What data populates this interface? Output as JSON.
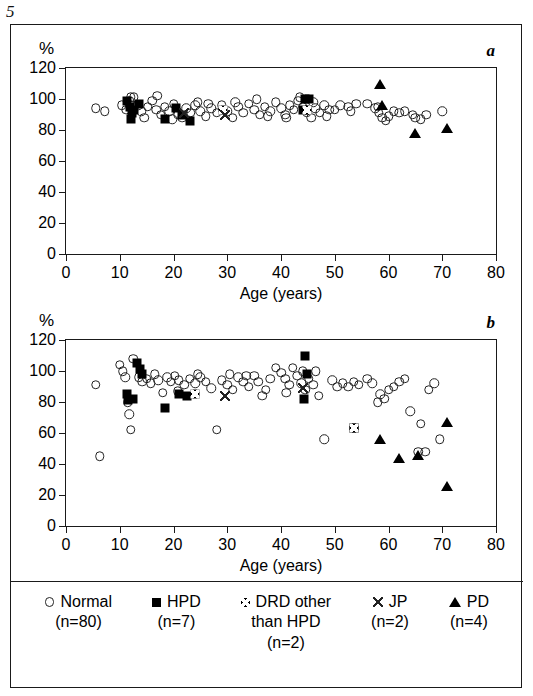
{
  "figure": {
    "number": "5",
    "x_title": "Age (years)",
    "y_unit": "%",
    "panel_a_letter": "a",
    "panel_b_letter": "b"
  },
  "axes": {
    "y_ticks": [
      0,
      20,
      40,
      60,
      80,
      100,
      120
    ],
    "x_ticks": [
      0,
      10,
      20,
      30,
      40,
      50,
      60,
      70,
      80
    ],
    "ylim": [
      0,
      120
    ],
    "xlim": [
      0,
      80
    ]
  },
  "legend": {
    "items": [
      {
        "symbol": "open-circle",
        "label": "Normal",
        "n": "(n=80)",
        "label2": ""
      },
      {
        "symbol": "filled-square",
        "label": "HPD",
        "n": "(n=7)",
        "label2": ""
      },
      {
        "symbol": "crossed-square",
        "label": "DRD other",
        "n": "(n=2)",
        "label2": "than HPD"
      },
      {
        "symbol": "cross",
        "label": "JP",
        "n": "(n=2)",
        "label2": ""
      },
      {
        "symbol": "filled-triangle",
        "label": "PD",
        "n": "(n=4)",
        "label2": ""
      }
    ]
  },
  "chart_data": [
    {
      "type": "scatter",
      "panel": "a",
      "title": "",
      "xlabel": "Age (years)",
      "ylabel": "%",
      "xlim": [
        0,
        80
      ],
      "ylim": [
        0,
        120
      ],
      "grid": false,
      "series": [
        {
          "name": "Normal",
          "marker": "open-circle",
          "points": [
            [
              5.5,
              94
            ],
            [
              7.2,
              92
            ],
            [
              10.4,
              96
            ],
            [
              11.2,
              93
            ],
            [
              11.8,
              99
            ],
            [
              12.6,
              101
            ],
            [
              13.4,
              96
            ],
            [
              14.0,
              92
            ],
            [
              14.6,
              88
            ],
            [
              15.2,
              95
            ],
            [
              16.0,
              99
            ],
            [
              16.8,
              93
            ],
            [
              17.6,
              90
            ],
            [
              18.4,
              95
            ],
            [
              19.2,
              92
            ],
            [
              20.0,
              97
            ],
            [
              20.8,
              90
            ],
            [
              21.6,
              88
            ],
            [
              22.4,
              94
            ],
            [
              23.2,
              91
            ],
            [
              24.0,
              96
            ],
            [
              25.0,
              92
            ],
            [
              26.0,
              89
            ],
            [
              27.0,
              94
            ],
            [
              28.0,
              91
            ],
            [
              29.0,
              96
            ],
            [
              30.0,
              92
            ],
            [
              31.0,
              88
            ],
            [
              32.0,
              95
            ],
            [
              33.0,
              91
            ],
            [
              34.0,
              97
            ],
            [
              35.0,
              93
            ],
            [
              36.0,
              90
            ],
            [
              37.0,
              95
            ],
            [
              38.0,
              92
            ],
            [
              39.0,
              98
            ],
            [
              40.0,
              94
            ],
            [
              40.8,
              90
            ],
            [
              41.6,
              96
            ],
            [
              42.4,
              93
            ],
            [
              43.2,
              99
            ],
            [
              44.0,
              95
            ],
            [
              44.8,
              91
            ],
            [
              45.6,
              88
            ],
            [
              46.4,
              94
            ],
            [
              47.2,
              91
            ],
            [
              48.0,
              96
            ],
            [
              49.0,
              93
            ],
            [
              51.0,
              96
            ],
            [
              52.5,
              95
            ],
            [
              54.0,
              97
            ],
            [
              57.5,
              94
            ],
            [
              58.2,
              91
            ],
            [
              58.8,
              88
            ],
            [
              59.5,
              86
            ],
            [
              61.0,
              92
            ],
            [
              62.0,
              91
            ],
            [
              63.0,
              92
            ],
            [
              64.5,
              90
            ],
            [
              66.0,
              87
            ],
            [
              70.0,
              92
            ],
            [
              12.0,
              101
            ],
            [
              17.0,
              102
            ],
            [
              24.5,
              98
            ],
            [
              35.5,
              100
            ],
            [
              43.5,
              101
            ],
            [
              46.0,
              98
            ],
            [
              50.0,
              93
            ],
            [
              53.0,
              92
            ],
            [
              56.0,
              97
            ],
            [
              58.0,
              95
            ],
            [
              60.0,
              89
            ],
            [
              65.0,
              88
            ],
            [
              67.0,
              90
            ],
            [
              19.8,
              87
            ],
            [
              26.5,
              97
            ],
            [
              31.5,
              98
            ],
            [
              37.5,
              89
            ],
            [
              41.0,
              88
            ],
            [
              48.5,
              89
            ]
          ]
        },
        {
          "name": "HPD",
          "marker": "filled-square",
          "points": [
            [
              11.3,
              99
            ],
            [
              11.9,
              95
            ],
            [
              12.2,
              91
            ],
            [
              12.0,
              87
            ],
            [
              12.7,
              93
            ],
            [
              13.5,
              97
            ],
            [
              18.5,
              87
            ],
            [
              20.5,
              94
            ],
            [
              21.5,
              90
            ],
            [
              23.0,
              86
            ],
            [
              44.5,
              100
            ],
            [
              45.3,
              100
            ],
            [
              44.0,
              93
            ]
          ]
        },
        {
          "name": "DRD other than HPD",
          "marker": "crossed-square",
          "points": [
            [
              29.2,
              93
            ],
            [
              44.8,
              93
            ]
          ]
        },
        {
          "name": "JP",
          "marker": "cross",
          "points": [
            [
              22.0,
              91
            ],
            [
              29.5,
              90
            ]
          ]
        },
        {
          "name": "PD",
          "marker": "filled-triangle",
          "points": [
            [
              58.5,
              110
            ],
            [
              58.8,
              96
            ],
            [
              65.0,
              78
            ],
            [
              70.8,
              81
            ]
          ]
        }
      ]
    },
    {
      "type": "scatter",
      "panel": "b",
      "title": "",
      "xlabel": "Age (years)",
      "ylabel": "%",
      "xlim": [
        0,
        80
      ],
      "ylim": [
        0,
        120
      ],
      "grid": false,
      "series": [
        {
          "name": "Normal",
          "marker": "open-circle",
          "points": [
            [
              5.5,
              91
            ],
            [
              6.3,
              45
            ],
            [
              10.0,
              104
            ],
            [
              10.6,
              100
            ],
            [
              11.0,
              96
            ],
            [
              11.5,
              80
            ],
            [
              11.8,
              72
            ],
            [
              12.0,
              62
            ],
            [
              13.5,
              96
            ],
            [
              14.2,
              93
            ],
            [
              15.0,
              95
            ],
            [
              15.8,
              92
            ],
            [
              16.5,
              98
            ],
            [
              17.2,
              94
            ],
            [
              18.0,
              86
            ],
            [
              18.8,
              96
            ],
            [
              19.5,
              93
            ],
            [
              20.2,
              97
            ],
            [
              21.0,
              94
            ],
            [
              22.0,
              91
            ],
            [
              23.0,
              95
            ],
            [
              24.0,
              92
            ],
            [
              25.0,
              96
            ],
            [
              26.0,
              93
            ],
            [
              27.0,
              89
            ],
            [
              28.0,
              62
            ],
            [
              29.0,
              94
            ],
            [
              30.0,
              91
            ],
            [
              31.0,
              88
            ],
            [
              32.0,
              96
            ],
            [
              33.0,
              93
            ],
            [
              34.0,
              90
            ],
            [
              35.0,
              97
            ],
            [
              35.8,
              93
            ],
            [
              36.5,
              84
            ],
            [
              37.2,
              88
            ],
            [
              38.0,
              95
            ],
            [
              39.0,
              102
            ],
            [
              40.0,
              99
            ],
            [
              40.8,
              95
            ],
            [
              41.5,
              91
            ],
            [
              42.2,
              102
            ],
            [
              43.0,
              97
            ],
            [
              43.8,
              92
            ],
            [
              44.5,
              88
            ],
            [
              45.2,
              95
            ],
            [
              46.0,
              91
            ],
            [
              47.0,
              84
            ],
            [
              48.0,
              56
            ],
            [
              49.5,
              94
            ],
            [
              50.5,
              90
            ],
            [
              51.5,
              92
            ],
            [
              52.5,
              90
            ],
            [
              53.5,
              93
            ],
            [
              54.5,
              91
            ],
            [
              56.0,
              95
            ],
            [
              57.0,
              92
            ],
            [
              58.5,
              85
            ],
            [
              59.2,
              82
            ],
            [
              60.0,
              88
            ],
            [
              61.0,
              90
            ],
            [
              62.0,
              93
            ],
            [
              63.0,
              95
            ],
            [
              64.0,
              74
            ],
            [
              66.0,
              66
            ],
            [
              67.5,
              88
            ],
            [
              68.5,
              92
            ],
            [
              69.5,
              56
            ],
            [
              58.0,
              80
            ],
            [
              24.5,
              98
            ],
            [
              30.5,
              98
            ],
            [
              44.0,
              100
            ],
            [
              46.5,
              100
            ],
            [
              12.5,
              108
            ],
            [
              20.8,
              87
            ],
            [
              33.5,
              97
            ],
            [
              41.0,
              86
            ],
            [
              65.5,
              48
            ],
            [
              66.8,
              48
            ]
          ]
        },
        {
          "name": "HPD",
          "marker": "filled-square",
          "points": [
            [
              11.3,
              85
            ],
            [
              11.5,
              81
            ],
            [
              12.5,
              82
            ],
            [
              13.2,
              105
            ],
            [
              13.8,
              101
            ],
            [
              14.2,
              98
            ],
            [
              18.5,
              76
            ],
            [
              21.0,
              85
            ],
            [
              22.5,
              84
            ],
            [
              44.5,
              110
            ],
            [
              44.8,
              98
            ],
            [
              44.2,
              82
            ],
            [
              53.5,
              63
            ]
          ]
        },
        {
          "name": "DRD other than HPD",
          "marker": "crossed-square",
          "points": [
            [
              24.0,
              85
            ],
            [
              53.5,
              63
            ]
          ]
        },
        {
          "name": "JP",
          "marker": "cross",
          "points": [
            [
              29.5,
              84
            ],
            [
              44.0,
              89
            ]
          ]
        },
        {
          "name": "PD",
          "marker": "filled-triangle",
          "points": [
            [
              58.5,
              56
            ],
            [
              62.0,
              44
            ],
            [
              65.5,
              46
            ],
            [
              70.8,
              67
            ],
            [
              70.8,
              26
            ]
          ]
        }
      ]
    }
  ]
}
